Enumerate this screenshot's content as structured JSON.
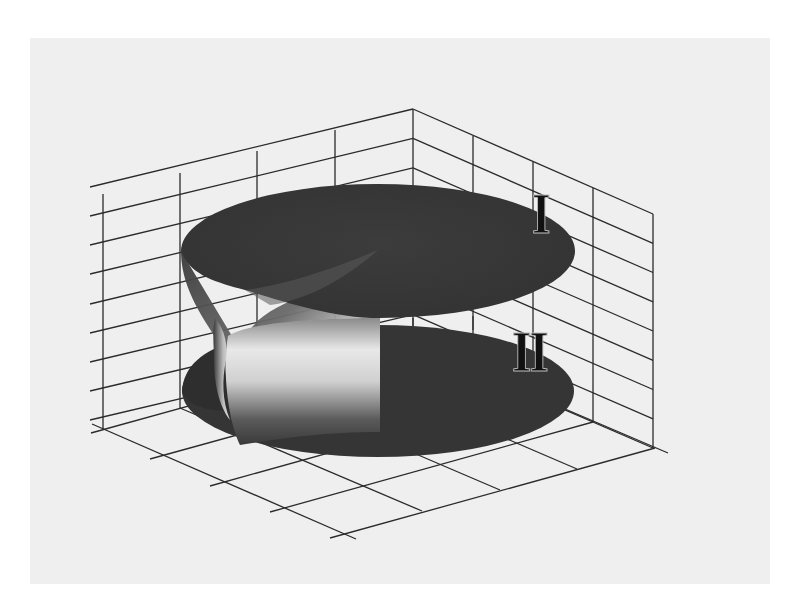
{
  "figure": {
    "type": "3D surface plot in box with grid walls",
    "sheet_labels": [
      "I",
      "II"
    ],
    "colors": {
      "background": "#ffffff",
      "paper": "#efefef",
      "grid_line": "#2b2b2b",
      "surface_dark": "#3a3a3a",
      "surface_highlight": "#e6e6e6"
    },
    "grid": {
      "left_wall": {
        "vertical_lines": 5,
        "horizontal_lines": 9
      },
      "right_wall": {
        "vertical_lines": 5,
        "horizontal_lines": 9
      },
      "floor": {
        "divisions_a": 4,
        "divisions_b": 4
      }
    }
  },
  "labels": {
    "sheet_1": "I",
    "sheet_2": "II"
  }
}
